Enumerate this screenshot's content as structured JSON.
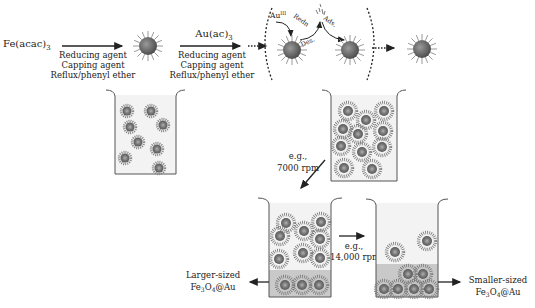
{
  "diagram": {
    "step1": {
      "precursor": "Fe(acac)",
      "precursor_sub": "3",
      "conditions": [
        "Reducing agent",
        "Capping agent",
        "Reflux/phenyl ether"
      ]
    },
    "step2": {
      "precursor": "Au(ac)",
      "precursor_sub": "3",
      "conditions": [
        "Reducing agent",
        "Capping agent",
        "Reflux/phenyl ether"
      ]
    },
    "mechanism": {
      "au_label": "Au",
      "au_sup": "III",
      "redn_label": "Redn",
      "des_label": "Des.",
      "ads_label": "Ads."
    },
    "centrifuge1": {
      "label_line1": "e.g.,",
      "label_line2": "7000 rpm"
    },
    "centrifuge2": {
      "label_line1": "e.g.,",
      "label_line2": "14,000 rpm"
    },
    "products": {
      "larger": {
        "line1": "Larger-sized",
        "formula": "Fe",
        "sub1": "3",
        "mid": "O",
        "sub2": "4",
        "tail": "@Au"
      },
      "smaller": {
        "line1": "Smaller-sized",
        "formula": "Fe",
        "sub1": "3",
        "mid": "O",
        "sub2": "4",
        "tail": "@Au"
      }
    },
    "colors": {
      "particle_core": "#6f6f6f",
      "particle_spikes": "#9a9a9a",
      "beaker_fill": "#f1f1f1",
      "sediment": "#c9c9c9",
      "line": "#333333"
    }
  }
}
